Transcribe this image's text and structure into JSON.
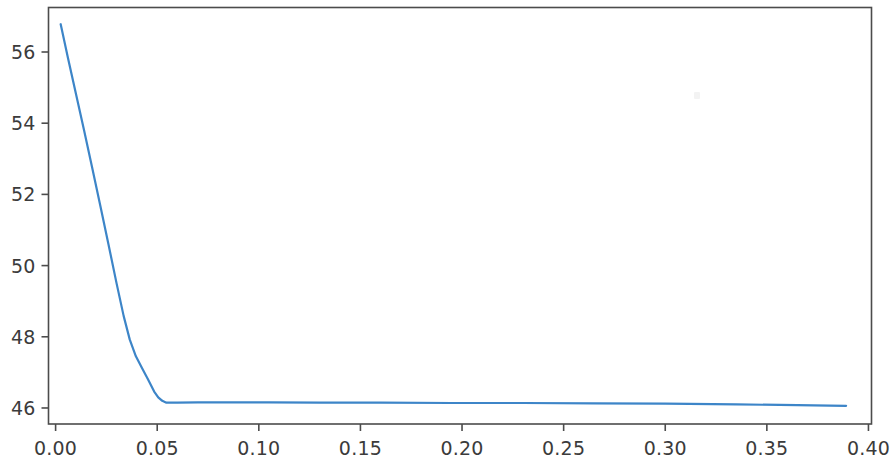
{
  "chart_data": {
    "type": "line",
    "title": "",
    "xlabel": "",
    "ylabel": "",
    "xlim": [
      -0.0035,
      0.4015
    ],
    "ylim": [
      45.55,
      57.25
    ],
    "grid": false,
    "legend": null,
    "line_color": "#3d85c8",
    "line_width": 2.2,
    "xticks": [
      0.0,
      0.05,
      0.1,
      0.15,
      0.2,
      0.25,
      0.3,
      0.35,
      0.4
    ],
    "xtick_labels": [
      "0.00",
      "0.05",
      "0.10",
      "0.15",
      "0.20",
      "0.25",
      "0.30",
      "0.35",
      "0.40"
    ],
    "yticks": [
      46,
      48,
      50,
      52,
      54,
      56
    ],
    "ytick_labels": [
      "46",
      "48",
      "50",
      "52",
      "54",
      "56"
    ],
    "series": [
      {
        "name": "curve",
        "x": [
          0.0025,
          0.006,
          0.01,
          0.014,
          0.018,
          0.022,
          0.026,
          0.03,
          0.0335,
          0.0365,
          0.0395,
          0.0425,
          0.0455,
          0.0485,
          0.0505,
          0.0525,
          0.0545,
          0.06,
          0.07,
          0.085,
          0.105,
          0.13,
          0.16,
          0.195,
          0.23,
          0.265,
          0.3,
          0.335,
          0.365,
          0.389
        ],
        "y": [
          56.78,
          55.85,
          54.83,
          53.8,
          52.75,
          51.68,
          50.6,
          49.5,
          48.58,
          47.92,
          47.45,
          47.12,
          46.8,
          46.46,
          46.3,
          46.2,
          46.15,
          46.15,
          46.16,
          46.16,
          46.16,
          46.15,
          46.15,
          46.14,
          46.14,
          46.13,
          46.12,
          46.1,
          46.08,
          46.06
        ]
      }
    ]
  },
  "axes": {
    "spine_color": "#4c4c4c",
    "background": "#ffffff"
  }
}
